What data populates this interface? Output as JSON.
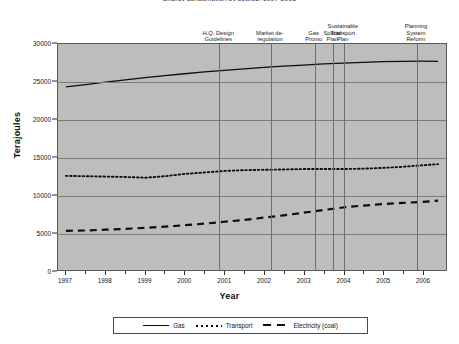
{
  "chart_data": {
    "type": "line",
    "title": "Energy consumption by source, 1997-2006",
    "xlabel": "Year",
    "ylabel": "Terajoules",
    "xlim": [
      1996.8,
      2006.6
    ],
    "ylim": [
      0,
      30000
    ],
    "yticks": [
      0,
      5000,
      10000,
      15000,
      20000,
      25000,
      30000
    ],
    "ytick_labels": [
      "0",
      "5000",
      "10000",
      "15000",
      "20000",
      "25000",
      "30000"
    ],
    "xticks": [
      1997,
      1998,
      1999,
      2000,
      2001,
      2002,
      2003,
      2004,
      2005,
      2006
    ],
    "xtick_labels": [
      "1997",
      "1998",
      "1999",
      "2000",
      "2001",
      "2002",
      "2003",
      "2004",
      "2005",
      "2006"
    ],
    "grid": true,
    "legend_position": "bottom",
    "x": [
      1997.0,
      1997.5,
      1998.0,
      1998.5,
      1999.0,
      1999.5,
      2000.0,
      2000.5,
      2001.0,
      2001.5,
      2002.0,
      2002.5,
      2003.0,
      2003.5,
      2004.0,
      2004.5,
      2005.0,
      2005.5,
      2006.0,
      2006.4
    ],
    "series": [
      {
        "name": "Gas",
        "style": "solid",
        "color": "#0d0d0d",
        "values": [
          24300,
          24600,
          24950,
          25250,
          25550,
          25800,
          26050,
          26300,
          26500,
          26700,
          26900,
          27050,
          27200,
          27350,
          27450,
          27550,
          27650,
          27700,
          27720,
          27700
        ]
      },
      {
        "name": "Transport",
        "style": "dotted",
        "color": "#0d0d0d",
        "values": [
          12500,
          12450,
          12400,
          12350,
          12250,
          12450,
          12750,
          12950,
          13150,
          13250,
          13300,
          13350,
          13400,
          13400,
          13400,
          13450,
          13550,
          13700,
          13900,
          14050
        ]
      },
      {
        "name": "Electricity (coal)",
        "style": "dashed",
        "color": "#0d0d0d",
        "values": [
          5200,
          5250,
          5350,
          5450,
          5600,
          5750,
          5950,
          6150,
          6400,
          6650,
          6950,
          7250,
          7600,
          7950,
          8300,
          8550,
          8750,
          8900,
          9050,
          9200
        ]
      }
    ],
    "annotations": [
      {
        "label": "H.Q. Design\nGuidelines",
        "x": 2000.85,
        "line_x": 2000.85
      },
      {
        "label": "Market de-\nregulation",
        "x": 2002.15,
        "line_x": 2002.15
      },
      {
        "label": "Gas\nPromo",
        "x": 2003.25,
        "line_x": 2003.25
      },
      {
        "label": "Spatial\nPlan",
        "x": 2003.72,
        "line_x": 2003.72
      },
      {
        "label": "Sustainable\nTransport\nPlan",
        "x": 2003.98,
        "line_x": 2003.98
      },
      {
        "label": "Planning\nSystem\nReform",
        "x": 2005.82,
        "line_x": 2005.82
      }
    ],
    "legend": [
      {
        "label": "Gas",
        "style": "solid"
      },
      {
        "label": "Transport",
        "style": "dotted"
      },
      {
        "label": "Electricity (coal)",
        "style": "dashed"
      }
    ]
  }
}
